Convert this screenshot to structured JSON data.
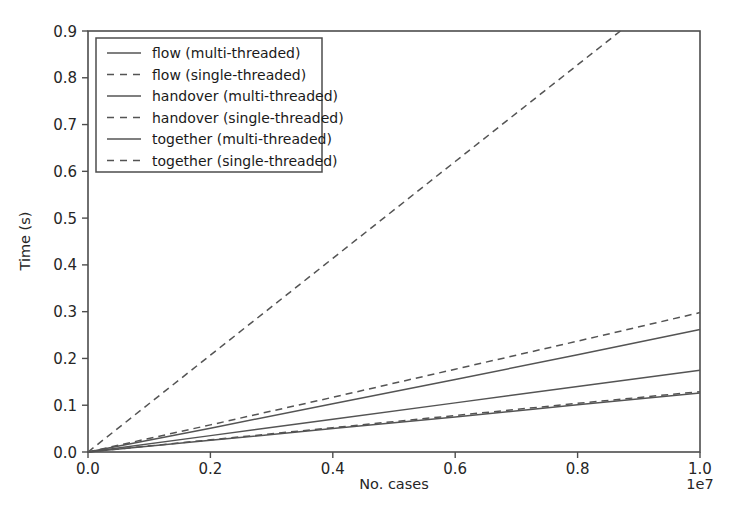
{
  "chart_data": {
    "type": "line",
    "title": "",
    "xlabel": "No. cases",
    "ylabel": "Time (s)",
    "x_exponent_label": "1e7",
    "xlim": [
      0.0,
      1.0
    ],
    "ylim": [
      0.0,
      0.9
    ],
    "x_ticks": [
      "0.0",
      "0.2",
      "0.4",
      "0.6",
      "0.8",
      "1.0"
    ],
    "x_tick_values": [
      0.0,
      0.2,
      0.4,
      0.6,
      0.8,
      1.0
    ],
    "y_ticks": [
      "0.0",
      "0.1",
      "0.2",
      "0.3",
      "0.4",
      "0.5",
      "0.6",
      "0.7",
      "0.8",
      "0.9"
    ],
    "y_tick_values": [
      0.0,
      0.1,
      0.2,
      0.3,
      0.4,
      0.5,
      0.6,
      0.7,
      0.8,
      0.9
    ],
    "grid": false,
    "legend_position": "upper left",
    "x_units_note": "x axis values are multiples of 1e7 cases",
    "series": [
      {
        "name": "flow (multi-threaded)",
        "style": "solid",
        "color": "#545454",
        "x": [
          0.0,
          0.2,
          0.4,
          0.6,
          0.8,
          1.0
        ],
        "values": [
          0.0,
          0.025,
          0.05,
          0.075,
          0.101,
          0.126
        ]
      },
      {
        "name": "flow (single-threaded)",
        "style": "dashed",
        "color": "#545454",
        "x": [
          0.0,
          0.2,
          0.4,
          0.6,
          0.8,
          1.0
        ],
        "values": [
          0.0,
          0.026,
          0.052,
          0.078,
          0.104,
          0.129
        ]
      },
      {
        "name": "handover (multi-threaded)",
        "style": "solid",
        "color": "#545454",
        "x": [
          0.0,
          0.2,
          0.4,
          0.6,
          0.8,
          1.0
        ],
        "values": [
          0.0,
          0.035,
          0.07,
          0.105,
          0.14,
          0.175
        ]
      },
      {
        "name": "handover (single-threaded)",
        "style": "dashed",
        "color": "#545454",
        "x": [
          0.0,
          0.2,
          0.4,
          0.6,
          0.8,
          1.0
        ],
        "values": [
          0.0,
          0.058,
          0.117,
          0.177,
          0.237,
          0.298
        ]
      },
      {
        "name": "together (multi-threaded)",
        "style": "solid",
        "color": "#545454",
        "x": [
          0.0,
          0.2,
          0.4,
          0.6,
          0.8,
          1.0
        ],
        "values": [
          0.0,
          0.051,
          0.103,
          0.155,
          0.208,
          0.262
        ]
      },
      {
        "name": "together (single-threaded)",
        "style": "dashed",
        "color": "#545454",
        "x": [
          0.0,
          0.2,
          0.4,
          0.6,
          0.87
        ],
        "values": [
          0.0,
          0.207,
          0.414,
          0.621,
          0.9
        ]
      }
    ]
  },
  "legend": {
    "entries": [
      {
        "label": "flow (multi-threaded)"
      },
      {
        "label": "flow (single-threaded)"
      },
      {
        "label": "handover (multi-threaded)"
      },
      {
        "label": "handover (single-threaded)"
      },
      {
        "label": "together (multi-threaded)"
      },
      {
        "label": "together (single-threaded)"
      }
    ]
  },
  "colors": {
    "line": "#545454",
    "axis": "#4d4d4d",
    "text": "#262626",
    "background": "#ffffff"
  }
}
